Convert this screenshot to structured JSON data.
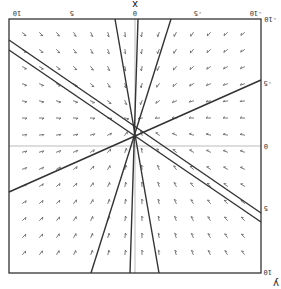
{
  "chart_data": {
    "type": "vector-field",
    "title": "",
    "orientation": "rotated 180 degrees",
    "xlabel": "x",
    "ylabel": "y",
    "xlim": [
      -10,
      10
    ],
    "ylim": [
      -10,
      10
    ],
    "x_ticks": [
      "10",
      "5",
      "0",
      "-5",
      "-10"
    ],
    "y_ticks": [
      "-10",
      "-5",
      "0",
      "5",
      "10"
    ],
    "grid": false,
    "axes_lines": true,
    "vector_grid": {
      "cols": 14,
      "rows": 14
    },
    "trajectories": [
      {
        "name": "line-1",
        "px": [
          [
            115,
            19
          ],
          [
            159,
            273
          ]
        ]
      },
      {
        "name": "line-2",
        "px": [
          [
            138,
            19
          ],
          [
            130,
            273
          ]
        ]
      },
      {
        "name": "line-3",
        "px": [
          [
            171,
            19
          ],
          [
            91,
            273
          ]
        ]
      },
      {
        "name": "line-4",
        "px": [
          [
            9,
            40
          ],
          [
            261,
            213
          ]
        ]
      },
      {
        "name": "line-5",
        "px": [
          [
            9,
            50
          ],
          [
            261,
            222
          ]
        ]
      },
      {
        "name": "line-6",
        "px": [
          [
            9,
            192
          ],
          [
            261,
            80
          ]
        ]
      }
    ]
  },
  "colors": {
    "frame": "#333333",
    "axis": "#999999",
    "line": "#333333",
    "arrow": "#555555"
  }
}
